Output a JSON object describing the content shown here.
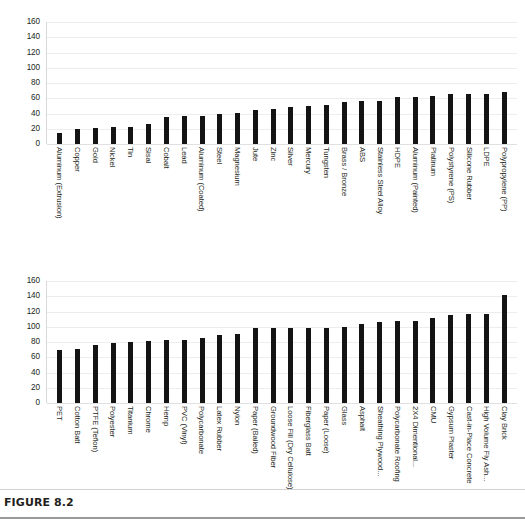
{
  "figure": {
    "caption": "FIGURE 8.2"
  },
  "chart_data": [
    {
      "type": "bar",
      "id": "top-chart",
      "title": "",
      "subtitle": "",
      "xlabel": "",
      "ylabel": "",
      "ylim": [
        0,
        160
      ],
      "yticks": [
        160,
        140,
        120,
        100,
        80,
        60,
        40,
        20,
        0
      ],
      "grid": true,
      "legend": null,
      "orientation": "vertical",
      "bar_color": "#141414",
      "categories": [
        "Aluminum (Extrusion)",
        "Copper",
        "Gold",
        "Nickel",
        "Tin",
        "Sisal",
        "Cobalt",
        "Lead",
        "Aluminum (Coated)",
        "Steel",
        "Magnesium",
        "Jute",
        "Zinc",
        "Silver",
        "Mercury",
        "Tungsten",
        "Brass / Bronze",
        "ABS",
        "Stainless Steel Alloy",
        "HDPE",
        "Aluminum (Painted)",
        "Platinum",
        "Polystyrene (PS)",
        "Silicone Rubber",
        "LDPE",
        "Polypropylene (PP)"
      ],
      "values": [
        14,
        20,
        21,
        22,
        22,
        26,
        36,
        37,
        37,
        40,
        41,
        44,
        46,
        48,
        50,
        51,
        55,
        56,
        57,
        62,
        62,
        63,
        65,
        65,
        66,
        68
      ]
    },
    {
      "type": "bar",
      "id": "bottom-chart",
      "title": "",
      "subtitle": "",
      "xlabel": "",
      "ylabel": "",
      "ylim": [
        0,
        160
      ],
      "yticks": [
        160,
        140,
        120,
        100,
        80,
        60,
        40,
        20,
        0
      ],
      "grid": true,
      "legend": null,
      "orientation": "vertical",
      "bar_color": "#141414",
      "categories": [
        "PET",
        "Cotton Batt",
        "PTFE (Teflon)",
        "Polyester",
        "Titanium",
        "Chrome",
        "Hemp",
        "PVC (Vinyl)",
        "Polycarbonate",
        "Latex Rubber",
        "Nylon",
        "Paper (Bailed)",
        "Groundwood Fiber",
        "Loose Fill (Dry Cellulose)",
        "Fiberglass Batt",
        "Paper (Loose)",
        "Glass",
        "Asphalt",
        "Sheathing Plywood...",
        "Polycarbonate Roofing",
        "2X4 Dimentional...",
        "CMU",
        "Gypsum Plaster",
        "Cast-in-Place Concrete",
        "High Volume Fly Ash...",
        "Clay Brick"
      ],
      "values": [
        70,
        71,
        76,
        79,
        80,
        81,
        82,
        83,
        85,
        89,
        91,
        98,
        98,
        98,
        99,
        99,
        100,
        104,
        106,
        107,
        108,
        111,
        116,
        117,
        117,
        142
      ]
    }
  ]
}
